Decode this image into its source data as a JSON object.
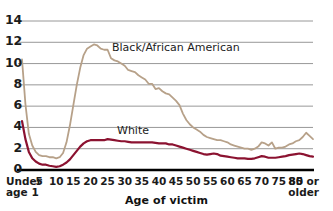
{
  "chart_data": {
    "type": "line",
    "title": "",
    "xlabel": "Age of victim",
    "ylabel": "",
    "ylim": [
      0,
      14
    ],
    "yticks": [
      0,
      2,
      4,
      6,
      8,
      10,
      12,
      14
    ],
    "grid": "horizontal",
    "legend": "inline-annotations",
    "categories": [
      "Under age 1",
      "1",
      "2",
      "3",
      "4",
      "5",
      "6",
      "7",
      "8",
      "9",
      "10",
      "11",
      "12",
      "13",
      "14",
      "15",
      "16",
      "17",
      "18",
      "19",
      "20",
      "21",
      "22",
      "23",
      "24",
      "25",
      "26",
      "27",
      "28",
      "29",
      "30",
      "31",
      "32",
      "33",
      "34",
      "35",
      "36",
      "37",
      "38",
      "39",
      "40",
      "41",
      "42",
      "43",
      "44",
      "45",
      "46",
      "47",
      "48",
      "49",
      "50",
      "51",
      "52",
      "53",
      "54",
      "55",
      "56",
      "57",
      "58",
      "59",
      "60",
      "61",
      "62",
      "63",
      "64",
      "65",
      "66",
      "67",
      "68",
      "69",
      "70",
      "71",
      "72",
      "73",
      "74",
      "75",
      "76",
      "77",
      "78",
      "79",
      "80",
      "81",
      "82",
      "83",
      "84",
      "85 or older"
    ],
    "xtick_labels": [
      "Under\nage 1",
      "5",
      "10",
      "15",
      "20",
      "25",
      "30",
      "35",
      "40",
      "45",
      "50",
      "55",
      "60",
      "65",
      "70",
      "75",
      "80",
      "85 or\nolder"
    ],
    "series": [
      {
        "name": "Black/African American",
        "color": "#b7a189",
        "values": [
          10.4,
          6.2,
          3.4,
          2.3,
          1.7,
          1.4,
          1.3,
          1.3,
          1.2,
          1.2,
          1.1,
          1.2,
          1.6,
          2.6,
          4.2,
          6.1,
          8.0,
          9.6,
          10.8,
          11.4,
          11.6,
          11.8,
          11.7,
          11.4,
          11.3,
          11.3,
          10.5,
          10.3,
          10.2,
          10.0,
          9.8,
          9.4,
          9.3,
          9.2,
          8.9,
          8.7,
          8.5,
          8.1,
          8.1,
          7.6,
          7.7,
          7.4,
          7.2,
          7.1,
          6.8,
          6.5,
          6.1,
          5.3,
          4.7,
          4.3,
          4.0,
          3.8,
          3.6,
          3.3,
          3.1,
          3.0,
          2.9,
          2.8,
          2.8,
          2.7,
          2.6,
          2.4,
          2.3,
          2.2,
          2.1,
          2.0,
          2.0,
          1.9,
          2.0,
          2.2,
          2.6,
          2.5,
          2.3,
          2.6,
          2.0,
          2.1,
          2.1,
          2.2,
          2.4,
          2.5,
          2.7,
          2.8,
          3.1,
          3.5,
          3.2,
          2.9
        ]
      },
      {
        "name": "White",
        "color": "#8b1230",
        "values": [
          4.6,
          2.9,
          1.7,
          1.1,
          0.8,
          0.6,
          0.5,
          0.5,
          0.4,
          0.35,
          0.3,
          0.35,
          0.5,
          0.7,
          1.0,
          1.4,
          1.8,
          2.2,
          2.5,
          2.7,
          2.8,
          2.8,
          2.8,
          2.8,
          2.8,
          2.9,
          2.85,
          2.8,
          2.75,
          2.7,
          2.7,
          2.65,
          2.6,
          2.6,
          2.6,
          2.6,
          2.6,
          2.6,
          2.6,
          2.55,
          2.5,
          2.5,
          2.5,
          2.4,
          2.4,
          2.3,
          2.2,
          2.1,
          2.0,
          1.9,
          1.8,
          1.7,
          1.6,
          1.5,
          1.45,
          1.5,
          1.55,
          1.5,
          1.35,
          1.3,
          1.25,
          1.2,
          1.15,
          1.1,
          1.1,
          1.1,
          1.05,
          1.05,
          1.1,
          1.2,
          1.3,
          1.25,
          1.15,
          1.15,
          1.15,
          1.2,
          1.25,
          1.3,
          1.4,
          1.45,
          1.5,
          1.55,
          1.5,
          1.4,
          1.3,
          1.25
        ]
      }
    ],
    "annotations": [
      {
        "text": "Black/African American",
        "series": "Black/African American"
      },
      {
        "text": "White",
        "series": "White"
      }
    ],
    "colors": {
      "grid": "#8c8c8c",
      "axis": "#000000",
      "black_african_american": "#b7a189",
      "white": "#8b1230",
      "text": "#1b1b1b",
      "background": "#ffffff"
    }
  }
}
